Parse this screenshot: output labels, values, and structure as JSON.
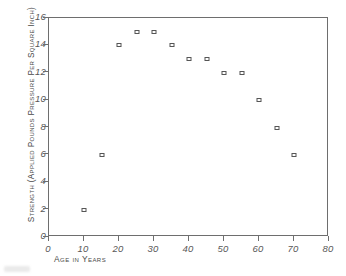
{
  "chart_data": {
    "type": "scatter",
    "title": "",
    "xlabel": "Age in Years",
    "ylabel": "Strength (Applied Pounds Pressure Per Square Inch)",
    "xlim": [
      0,
      80
    ],
    "ylim": [
      0,
      16
    ],
    "xticks": [
      "0",
      "10",
      "20",
      "30",
      "40",
      "50",
      "60",
      "70",
      "80"
    ],
    "yticks": [
      "0",
      "2",
      "4",
      "6",
      "8",
      "10",
      "12",
      "14",
      "16"
    ],
    "grid": false,
    "legend": null,
    "marker": "open-square",
    "x": [
      10,
      15,
      20,
      25,
      30,
      35,
      40,
      45,
      50,
      55,
      60,
      65,
      70
    ],
    "y": [
      2,
      6,
      14,
      15,
      15,
      14,
      13,
      13,
      12,
      12,
      10,
      8,
      6
    ],
    "points": [
      {
        "x": 10,
        "y": 2
      },
      {
        "x": 15,
        "y": 6
      },
      {
        "x": 20,
        "y": 14
      },
      {
        "x": 25,
        "y": 15
      },
      {
        "x": 30,
        "y": 15
      },
      {
        "x": 35,
        "y": 14
      },
      {
        "x": 40,
        "y": 13
      },
      {
        "x": 45,
        "y": 13
      },
      {
        "x": 50,
        "y": 12
      },
      {
        "x": 55,
        "y": 12
      },
      {
        "x": 60,
        "y": 10
      },
      {
        "x": 65,
        "y": 8
      },
      {
        "x": 70,
        "y": 6
      }
    ]
  },
  "colors": {
    "axis": "#6e6e6e",
    "marker_stroke": "#555555",
    "marker_fill": "#ffffff",
    "text": "#4a4a4a",
    "background": "#ffffff"
  }
}
